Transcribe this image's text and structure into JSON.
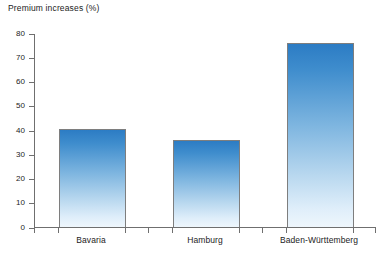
{
  "chart_data": {
    "type": "bar",
    "title": "Premium increases (%)",
    "xlabel": "",
    "ylabel": "",
    "categories": [
      "Bavaria",
      "Hamburg",
      "Baden-Württemberg"
    ],
    "values": [
      40.5,
      36,
      76
    ],
    "ylim": [
      0,
      80
    ],
    "y_ticks": [
      0,
      10,
      20,
      30,
      40,
      50,
      60,
      70,
      80
    ],
    "y_tick_labels": [
      "0",
      "10",
      "20",
      "30",
      "40",
      "50",
      "60",
      "70",
      "80"
    ],
    "grid": false,
    "legend": null,
    "series": [
      {
        "name": "Premium increases (%)",
        "values": [
          40.5,
          36,
          76
        ]
      }
    ],
    "bar_color_top": "#2c7cc4",
    "bar_color_bottom": "#eef6fc",
    "axis_color": "#6f6f6f"
  }
}
